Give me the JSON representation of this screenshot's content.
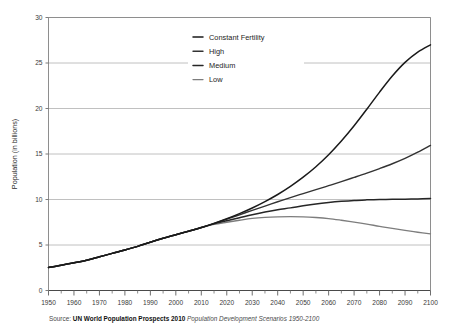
{
  "chart_data": {
    "type": "line",
    "title": "",
    "xlabel": "",
    "ylabel": "Population (in billions)",
    "xlim": [
      1950,
      2100
    ],
    "ylim": [
      0,
      30
    ],
    "grid": "horizontal",
    "legend_position": "top-center",
    "y_ticks": [
      0,
      5,
      10,
      15,
      20,
      25,
      30
    ],
    "y_tick_labels": [
      "0",
      "5",
      "10",
      "15",
      "20",
      "25",
      "30"
    ],
    "x_ticks": [
      1950,
      1960,
      1970,
      1980,
      1990,
      2000,
      2010,
      2020,
      2030,
      2040,
      2050,
      2060,
      2070,
      2080,
      2090,
      2100
    ],
    "x_tick_labels": [
      "1950",
      "1960",
      "1970",
      "1980",
      "1990",
      "2000",
      "2010",
      "2020",
      "2030",
      "2040",
      "2050",
      "2060",
      "2070",
      "2080",
      "2090",
      "2100"
    ],
    "x_minor_tick_step": 5,
    "x": [
      1950,
      1955,
      1960,
      1965,
      1970,
      1975,
      1980,
      1985,
      1990,
      1995,
      2000,
      2005,
      2010,
      2015,
      2020,
      2025,
      2030,
      2035,
      2040,
      2045,
      2050,
      2055,
      2060,
      2065,
      2070,
      2075,
      2080,
      2085,
      2090,
      2095,
      2100
    ],
    "series": [
      {
        "name": "Constant Fertility",
        "color": "#1a1a1a",
        "width": 1.5,
        "values": [
          2.53,
          2.77,
          3.04,
          3.33,
          3.7,
          4.08,
          4.45,
          4.85,
          5.31,
          5.74,
          6.13,
          6.52,
          6.92,
          7.38,
          7.89,
          8.45,
          9.07,
          9.77,
          10.55,
          11.44,
          12.45,
          13.6,
          14.92,
          16.42,
          18.1,
          19.92,
          21.8,
          23.57,
          25.07,
          26.2,
          27.0
        ]
      },
      {
        "name": "High",
        "color": "#333333",
        "width": 1.4,
        "values": [
          2.53,
          2.77,
          3.04,
          3.33,
          3.7,
          4.08,
          4.45,
          4.85,
          5.31,
          5.74,
          6.13,
          6.52,
          6.92,
          7.37,
          7.84,
          8.32,
          8.81,
          9.28,
          9.75,
          10.21,
          10.65,
          11.08,
          11.52,
          11.97,
          12.43,
          12.9,
          13.4,
          13.93,
          14.52,
          15.2,
          15.95
        ]
      },
      {
        "name": "Medium",
        "color": "#262626",
        "width": 1.5,
        "values": [
          2.53,
          2.77,
          3.04,
          3.33,
          3.7,
          4.08,
          4.45,
          4.85,
          5.31,
          5.74,
          6.13,
          6.52,
          6.92,
          7.32,
          7.66,
          7.99,
          8.32,
          8.62,
          8.87,
          9.08,
          9.31,
          9.51,
          9.67,
          9.8,
          9.9,
          9.96,
          10.0,
          10.02,
          10.04,
          10.06,
          10.1
        ]
      },
      {
        "name": "Low",
        "color": "#7d7d7d",
        "width": 1.3,
        "values": [
          2.53,
          2.77,
          3.04,
          3.33,
          3.7,
          4.08,
          4.45,
          4.85,
          5.31,
          5.74,
          6.13,
          6.52,
          6.92,
          7.26,
          7.5,
          7.72,
          7.92,
          8.04,
          8.1,
          8.12,
          8.1,
          8.02,
          7.9,
          7.72,
          7.52,
          7.3,
          7.05,
          6.82,
          6.6,
          6.4,
          6.22
        ]
      }
    ]
  },
  "legend": {
    "items": [
      {
        "label": "Constant Fertility"
      },
      {
        "label": "High"
      },
      {
        "label": "Medium"
      },
      {
        "label": "Low"
      }
    ]
  },
  "source_note": {
    "prefix": "Source: ",
    "bold": "UN World Population Prospects 2010",
    "italic": " Population Development Scenarios 1950-2100"
  }
}
